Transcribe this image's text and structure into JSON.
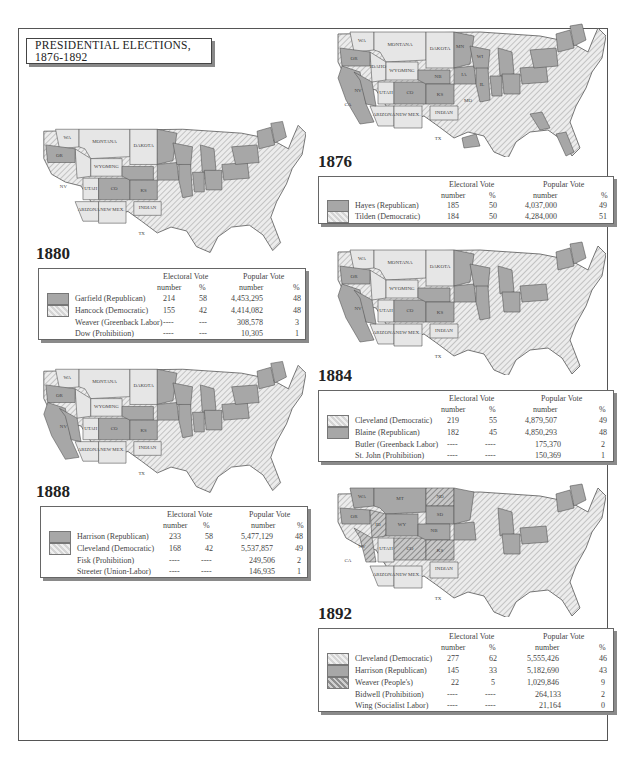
{
  "title": "PRESIDENTIAL ELECTIONS, 1876-1892",
  "colors": {
    "republican": "#a7a7a7",
    "democratic_hatch": "#d4d4d4",
    "peoples_hatch": "#8e8e8e",
    "territory": "#e6e6e6",
    "border": "#555555"
  },
  "headers": {
    "electoral": "Electoral Vote",
    "popular": "Popular Vote",
    "number": "number",
    "percent": "%"
  },
  "elections": [
    {
      "year": "1876",
      "candidates": [
        {
          "name": "Hayes (Republican)",
          "party": "republican",
          "ev_number": "185",
          "ev_pct": "50",
          "pv_number": "4,037,000",
          "pv_pct": "49"
        },
        {
          "name": "Tilden (Democratic)",
          "party": "democratic",
          "ev_number": "184",
          "ev_pct": "50",
          "pv_number": "4,284,000",
          "pv_pct": "51"
        }
      ]
    },
    {
      "year": "1880",
      "candidates": [
        {
          "name": "Garfield (Republican)",
          "party": "republican",
          "ev_number": "214",
          "ev_pct": "58",
          "pv_number": "4,453,295",
          "pv_pct": "48"
        },
        {
          "name": "Hancock (Democratic)",
          "party": "democratic",
          "ev_number": "155",
          "ev_pct": "42",
          "pv_number": "4,414,082",
          "pv_pct": "48"
        },
        {
          "name": "Weaver (Greenback Labor)",
          "party": "",
          "ev_number": "----",
          "ev_pct": "---",
          "pv_number": "308,578",
          "pv_pct": "3"
        },
        {
          "name": "Dow (Prohibition)",
          "party": "",
          "ev_number": "----",
          "ev_pct": "---",
          "pv_number": "10,305",
          "pv_pct": "1"
        }
      ]
    },
    {
      "year": "1884",
      "candidates": [
        {
          "name": "Cleveland (Democratic)",
          "party": "democratic",
          "ev_number": "219",
          "ev_pct": "55",
          "pv_number": "4,879,507",
          "pv_pct": "49"
        },
        {
          "name": "Blaine (Republican)",
          "party": "republican",
          "ev_number": "182",
          "ev_pct": "45",
          "pv_number": "4,850,293",
          "pv_pct": "48"
        },
        {
          "name": "Butler (Greenback Labor)",
          "party": "",
          "ev_number": "----",
          "ev_pct": "----",
          "pv_number": "175,370",
          "pv_pct": "2"
        },
        {
          "name": "St. John (Prohibition)",
          "party": "",
          "ev_number": "----",
          "ev_pct": "----",
          "pv_number": "150,369",
          "pv_pct": "1"
        }
      ]
    },
    {
      "year": "1888",
      "candidates": [
        {
          "name": "Harrison (Republican)",
          "party": "republican",
          "ev_number": "233",
          "ev_pct": "58",
          "pv_number": "5,477,129",
          "pv_pct": "48"
        },
        {
          "name": "Cleveland (Democratic)",
          "party": "democratic",
          "ev_number": "168",
          "ev_pct": "42",
          "pv_number": "5,537,857",
          "pv_pct": "49"
        },
        {
          "name": "Fisk (Prohibition)",
          "party": "",
          "ev_number": "----",
          "ev_pct": "----",
          "pv_number": "249,506",
          "pv_pct": "2"
        },
        {
          "name": "Streeter (Union-Labor)",
          "party": "",
          "ev_number": "----",
          "ev_pct": "----",
          "pv_number": "146,935",
          "pv_pct": "1"
        }
      ]
    },
    {
      "year": "1892",
      "candidates": [
        {
          "name": "Cleveland (Democratic)",
          "party": "democratic",
          "ev_number": "277",
          "ev_pct": "62",
          "pv_number": "5,555,426",
          "pv_pct": "46"
        },
        {
          "name": "Harrison (Republican)",
          "party": "republican",
          "ev_number": "145",
          "ev_pct": "33",
          "pv_number": "5,182,690",
          "pv_pct": "43"
        },
        {
          "name": "Weaver (People's)",
          "party": "peoples",
          "ev_number": "22",
          "ev_pct": "5",
          "pv_number": "1,029,846",
          "pv_pct": "9"
        },
        {
          "name": "Bidwell (Prohibition)",
          "party": "",
          "ev_number": "----",
          "ev_pct": "----",
          "pv_number": "264,133",
          "pv_pct": "2"
        },
        {
          "name": "Wing (Socialist Labor)",
          "party": "",
          "ev_number": "----",
          "ev_pct": "----",
          "pv_number": "21,164",
          "pv_pct": "0"
        }
      ]
    }
  ],
  "map_labels": {
    "territories": [
      "WA TERR.",
      "MONTANA TERR.",
      "DAKOTA TERR.",
      "IDAHO TERR.",
      "WYOMING TERR.",
      "UTAH TERR.",
      "ARIZONA TERR.",
      "NEW MEXICO TERR.",
      "INDIAN TERR."
    ],
    "states_1892": [
      "WA 4",
      "MT 3",
      "ND",
      "SD 4",
      "ID",
      "WY 3",
      "NB 8",
      "KS 10",
      "CO 4",
      "NV 3"
    ]
  }
}
